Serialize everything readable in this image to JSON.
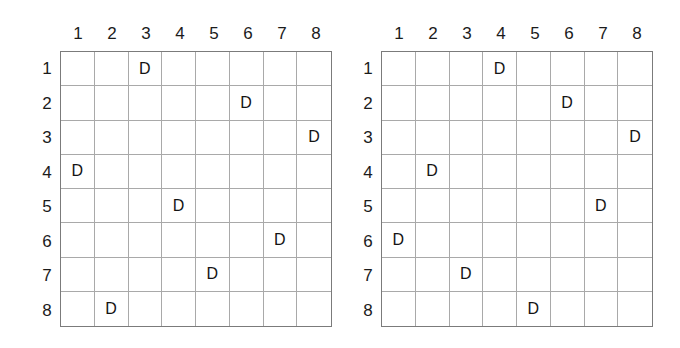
{
  "page": {
    "background_color": "#ffffff",
    "mark_color": "#141414",
    "grid_line_color": "#a9a9a9",
    "border_color": "#7b7b7b",
    "mark_symbol": "D"
  },
  "grids": [
    {
      "name": "left-grid",
      "size": 8,
      "column_headers": [
        "1",
        "2",
        "3",
        "4",
        "5",
        "6",
        "7",
        "8"
      ],
      "row_headers": [
        "1",
        "2",
        "3",
        "4",
        "5",
        "6",
        "7",
        "8"
      ],
      "marks": [
        {
          "row": 1,
          "col": 3,
          "label": "D"
        },
        {
          "row": 2,
          "col": 6,
          "label": "D"
        },
        {
          "row": 3,
          "col": 8,
          "label": "D"
        },
        {
          "row": 4,
          "col": 1,
          "label": "D"
        },
        {
          "row": 5,
          "col": 4,
          "label": "D"
        },
        {
          "row": 6,
          "col": 7,
          "label": "D"
        },
        {
          "row": 7,
          "col": 5,
          "label": "D"
        },
        {
          "row": 8,
          "col": 2,
          "label": "D"
        }
      ],
      "marks_by_row": [
        3,
        6,
        8,
        1,
        4,
        7,
        5,
        2
      ]
    },
    {
      "name": "right-grid",
      "size": 8,
      "column_headers": [
        "1",
        "2",
        "3",
        "4",
        "5",
        "6",
        "7",
        "8"
      ],
      "row_headers": [
        "1",
        "2",
        "3",
        "4",
        "5",
        "6",
        "7",
        "8"
      ],
      "marks": [
        {
          "row": 1,
          "col": 4,
          "label": "D"
        },
        {
          "row": 2,
          "col": 6,
          "label": "D"
        },
        {
          "row": 3,
          "col": 8,
          "label": "D"
        },
        {
          "row": 4,
          "col": 2,
          "label": "D"
        },
        {
          "row": 5,
          "col": 7,
          "label": "D"
        },
        {
          "row": 6,
          "col": 1,
          "label": "D"
        },
        {
          "row": 7,
          "col": 3,
          "label": "D"
        },
        {
          "row": 8,
          "col": 5,
          "label": "D"
        }
      ],
      "marks_by_row": [
        4,
        6,
        8,
        2,
        7,
        1,
        3,
        5
      ]
    }
  ]
}
